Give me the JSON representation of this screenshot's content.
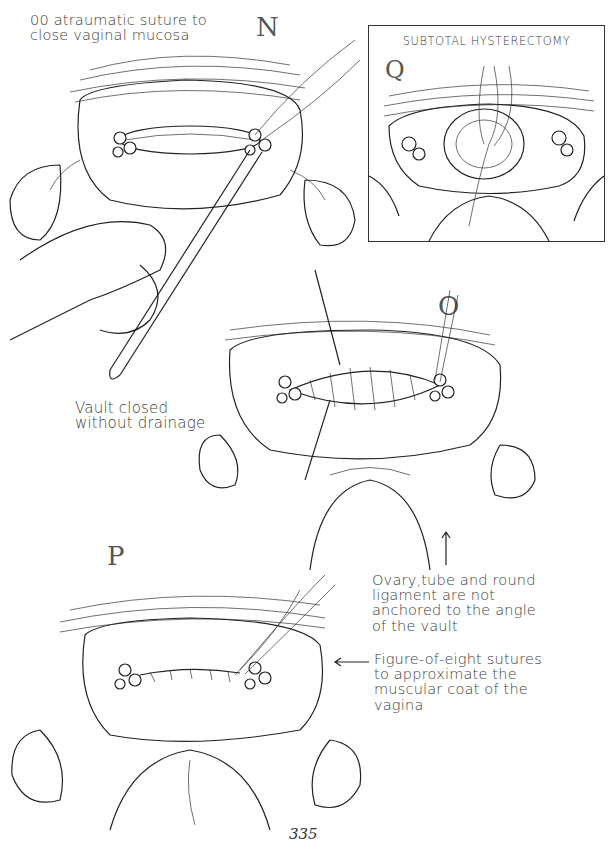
{
  "page": {
    "page_number": "335"
  },
  "figures": {
    "N": {
      "label": "N",
      "caption_lines": [
        "00 atraumatic suture to",
        "close vaginal mucosa"
      ]
    },
    "O": {
      "label": "O",
      "caption_lines": [
        "Vault closed",
        "without drainage"
      ],
      "annotation_lines": [
        "Ovary,tube and round",
        "ligament are not",
        "anchored to the angle",
        "of the vault"
      ]
    },
    "P": {
      "label": "P",
      "annotation_lines": [
        "Figure-of-eight sutures",
        "to approximate the",
        "muscular coat of the",
        "vagina"
      ]
    },
    "Q": {
      "label": "Q",
      "title": "SUBTOTAL HYSTERECTOMY"
    }
  }
}
